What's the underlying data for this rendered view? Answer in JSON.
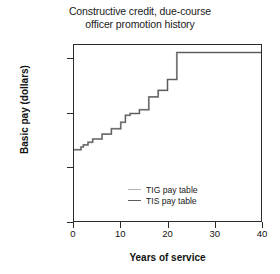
{
  "chart_data": {
    "type": "line",
    "title": "Constructive credit, due-course officer promotion history",
    "title_line1": "Constructive credit, due-course",
    "title_line2": "officer promotion history",
    "xlabel": "Years of service",
    "ylabel": "Basic pay (dollars)",
    "xlim": [
      0,
      40
    ],
    "ylim": [
      0,
      16300
    ],
    "xticks": [
      0,
      10,
      20,
      30,
      40
    ],
    "xtick_labels": [
      "0",
      "10",
      "20",
      "30",
      "40"
    ],
    "yticks": [
      0,
      5000,
      10000,
      15000
    ],
    "ytick_labels": [
      "0",
      "5,000",
      "10,000",
      "15,000"
    ],
    "grid": false,
    "legend_position": "lower-center-right",
    "drawstyle": "steps-post",
    "series": [
      {
        "name": "TIG pay table",
        "color": "#b3b3b3",
        "x": [
          0,
          1.5,
          2,
          3,
          4,
          6,
          8,
          10,
          11,
          12,
          14,
          16,
          18,
          20,
          22,
          40
        ],
        "values": [
          6600,
          6850,
          7050,
          7300,
          7600,
          8050,
          8550,
          9150,
          9800,
          9950,
          10300,
          11500,
          12100,
          13100,
          15600,
          15600
        ]
      },
      {
        "name": "TIS pay table",
        "color": "#5c5c5c",
        "x": [
          0,
          1.5,
          2,
          3,
          4,
          6,
          8,
          10,
          11,
          12,
          14,
          16,
          18,
          20,
          22,
          40
        ],
        "values": [
          6600,
          6850,
          7050,
          7300,
          7600,
          8050,
          8550,
          9150,
          9800,
          9950,
          10300,
          11500,
          12100,
          13100,
          15600,
          15600
        ]
      }
    ]
  },
  "legend": {
    "items": [
      {
        "label": "TIG pay table",
        "color": "#b3b3b3"
      },
      {
        "label": "TIS pay table",
        "color": "#5c5c5c"
      }
    ]
  }
}
